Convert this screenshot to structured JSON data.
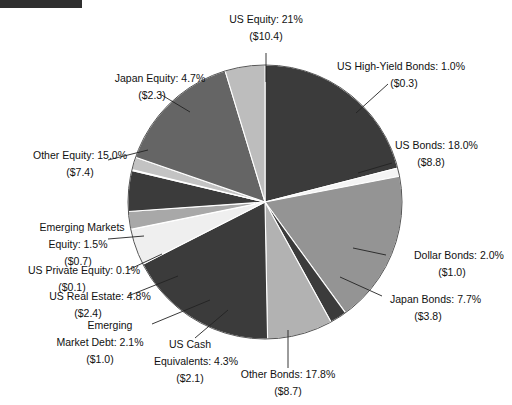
{
  "meta": {
    "redaction_bar": true
  },
  "chart_data": {
    "type": "pie",
    "title": "",
    "subtitle": "",
    "xlabel": "",
    "ylabel": "",
    "legend_position": "none",
    "grid": false,
    "value_unit": "$ billions",
    "label_format": "{name}: {percent}% ({value})",
    "start_angle_deg": 0,
    "direction": "clockwise",
    "categories": [
      "US Equity",
      "US High-Yield Bonds",
      "US Bonds",
      "Dollar Bonds",
      "Japan Bonds",
      "Other Bonds",
      "US Cash Equivalents",
      "Emerging Market Debt",
      "US Real Estate",
      "US Private Equity",
      "Emerging Markets Equity",
      "Other Equity",
      "Japan Equity"
    ],
    "values": [
      10.4,
      0.3,
      8.8,
      1.0,
      3.8,
      8.7,
      2.1,
      1.0,
      2.4,
      0.1,
      0.7,
      7.4,
      2.3
    ],
    "percents": [
      21.0,
      1.0,
      18.0,
      2.0,
      7.7,
      17.8,
      4.3,
      2.1,
      4.8,
      0.1,
      1.5,
      15.0,
      4.7
    ],
    "colors": [
      "#3b3b3b",
      "#f4f4f4",
      "#949494",
      "#3b3b3b",
      "#b2b2b2",
      "#3b3b3b",
      "#efefef",
      "#a8a8a8",
      "#3b3b3b",
      "#8f8f8f",
      "#c3c3c3",
      "#656565",
      "#bdbdbd"
    ],
    "slices": [
      {
        "name": "US Equity",
        "percent_label": "US Equity: 21%",
        "value_label": "($10.4)",
        "percent": 21.0,
        "value": 10.4,
        "color": "#3b3b3b"
      },
      {
        "name": "US High-Yield Bonds",
        "percent_label": "US High-Yield Bonds: 1.0%",
        "value_label": "($0.3)",
        "percent": 1.0,
        "value": 0.3,
        "color": "#f4f4f4"
      },
      {
        "name": "US Bonds",
        "percent_label": "US Bonds: 18.0%",
        "value_label": "($8.8)",
        "percent": 18.0,
        "value": 8.8,
        "color": "#949494"
      },
      {
        "name": "Dollar Bonds",
        "percent_label": "Dollar Bonds: 2.0%",
        "value_label": "($1.0)",
        "percent": 2.0,
        "value": 1.0,
        "color": "#3b3b3b"
      },
      {
        "name": "Japan Bonds",
        "percent_label": "Japan Bonds: 7.7%",
        "value_label": "($3.8)",
        "percent": 7.7,
        "value": 3.8,
        "color": "#b2b2b2"
      },
      {
        "name": "Other Bonds",
        "percent_label": "Other Bonds: 17.8%",
        "value_label": "($8.7)",
        "percent": 17.8,
        "value": 8.7,
        "color": "#3b3b3b"
      },
      {
        "name": "US Cash Equivalents",
        "percent_label": "US Cash",
        "percent_label2": "Equivalents: 4.3%",
        "value_label": "($2.1)",
        "percent": 4.3,
        "value": 2.1,
        "color": "#efefef"
      },
      {
        "name": "Emerging Market Debt",
        "percent_label": "Emerging",
        "percent_label2": "Market Debt: 2.1%",
        "value_label": "($1.0)",
        "percent": 2.1,
        "value": 1.0,
        "color": "#a8a8a8"
      },
      {
        "name": "US Real Estate",
        "percent_label": "US Real Estate: 4.8%",
        "value_label": "($2.4)",
        "percent": 4.8,
        "value": 2.4,
        "color": "#3b3b3b"
      },
      {
        "name": "US Private Equity",
        "percent_label": "US Private Equity: 0.1%",
        "value_label": "($0.1)",
        "percent": 0.1,
        "value": 0.1,
        "color": "#8f8f8f"
      },
      {
        "name": "Emerging Markets Equity",
        "percent_label": "Emerging Markets",
        "percent_label2": "Equity: 1.5%",
        "value_label": "($0.7)",
        "percent": 1.5,
        "value": 0.7,
        "color": "#c3c3c3"
      },
      {
        "name": "Other Equity",
        "percent_label": "Other Equity: 15.0%",
        "value_label": "($7.4)",
        "percent": 15.0,
        "value": 7.4,
        "color": "#656565"
      },
      {
        "name": "Japan Equity",
        "percent_label": "Japan Equity: 4.7%",
        "value_label": "($2.3)",
        "percent": 4.7,
        "value": 2.3,
        "color": "#bdbdbd"
      }
    ]
  },
  "labels": {
    "us_equity": {
      "line1": "US Equity: 21%",
      "line2": "($10.4)"
    },
    "us_high_yield_bonds": {
      "line1": "US High-Yield Bonds: 1.0%",
      "line2": "($0.3)"
    },
    "us_bonds": {
      "line1": "US Bonds: 18.0%",
      "line2": "($8.8)"
    },
    "dollar_bonds": {
      "line1": "Dollar Bonds: 2.0%",
      "line2": "($1.0)"
    },
    "japan_bonds": {
      "line1": "Japan Bonds: 7.7%",
      "line2": "($3.8)"
    },
    "other_bonds": {
      "line1": "Other Bonds: 17.8%",
      "line2": "($8.7)"
    },
    "us_cash_equivalents": {
      "line1": "US Cash",
      "line2": "Equivalents: 4.3%",
      "line3": "($2.1)"
    },
    "emerging_market_debt": {
      "line1": "Emerging",
      "line2": "Market Debt: 2.1%",
      "line3": "($1.0)"
    },
    "us_real_estate": {
      "line1": "US Real Estate: 4.8%",
      "line2": "($2.4)"
    },
    "us_private_equity": {
      "line1": "US Private Equity: 0.1%",
      "line2": "($0.1)"
    },
    "emerging_markets_equity": {
      "line1": "Emerging Markets",
      "line2": "Equity: 1.5%",
      "line3": "($0.7)"
    },
    "other_equity": {
      "line1": "Other Equity: 15.0%",
      "line2": "($7.4)"
    },
    "japan_equity": {
      "line1": "Japan Equity: 4.7%",
      "line2": "($2.3)"
    }
  }
}
